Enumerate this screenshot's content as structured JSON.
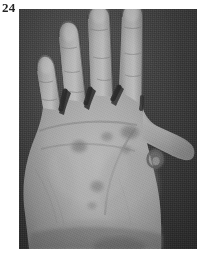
{
  "figure": {
    "number": "24",
    "caption": "",
    "modality": "grayscale-photograph"
  },
  "photo": {
    "alt_description": "Grayscale clinical photograph of an open left palm with fingers spread, showing several rounded hyperpigmented macular lesions on the palmar surface",
    "background_color": "#3a3a3a",
    "skin_midtone_color": "#a3a3a3",
    "skin_highlight_color": "#c8c8c8",
    "skin_shadow_color": "#6e6e6e",
    "lesion_color": "#7a7a7a",
    "frame": {
      "x": 19,
      "y": 9,
      "width": 178,
      "height": 240
    }
  },
  "anatomy": {
    "view": "palmar",
    "digits": [
      {
        "name": "little-finger",
        "label": "V"
      },
      {
        "name": "ring-finger",
        "label": "IV"
      },
      {
        "name": "middle-finger",
        "label": "III"
      },
      {
        "name": "index-finger",
        "label": "II"
      },
      {
        "name": "thumb",
        "label": "I"
      }
    ],
    "regions": [
      "thenar-eminence",
      "hypothenar-eminence",
      "central-palm",
      "wrist"
    ]
  },
  "lesions": [
    {
      "id": "lesion-1",
      "cx": 60,
      "cy": 138,
      "rx": 9.5,
      "ry": 7.5,
      "intensity": 0.3
    },
    {
      "id": "lesion-2",
      "cx": 88,
      "cy": 128,
      "rx": 7.0,
      "ry": 5.5,
      "intensity": 0.22
    },
    {
      "id": "lesion-3",
      "cx": 111,
      "cy": 124,
      "rx": 11.0,
      "ry": 8.0,
      "intensity": 0.34
    },
    {
      "id": "lesion-4",
      "cx": 107,
      "cy": 141,
      "rx": 6.0,
      "ry": 5.0,
      "intensity": 0.2
    },
    {
      "id": "lesion-5",
      "cx": 136,
      "cy": 150,
      "rx": 8.5,
      "ry": 9.5,
      "intensity": 0.46
    },
    {
      "id": "lesion-6",
      "cx": 78,
      "cy": 178,
      "rx": 8.0,
      "ry": 7.0,
      "intensity": 0.26
    },
    {
      "id": "lesion-7",
      "cx": 73,
      "cy": 197,
      "rx": 5.5,
      "ry": 4.5,
      "intensity": 0.18
    }
  ],
  "page": {
    "background_color": "#ffffff",
    "width": 209,
    "height": 260
  }
}
